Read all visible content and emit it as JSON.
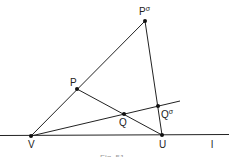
{
  "diagram": {
    "points": {
      "P_sigma": {
        "label": "P",
        "sup": "σ",
        "x": 145,
        "y": 21
      },
      "P": {
        "label": "P",
        "x": 77,
        "y": 89
      },
      "Q": {
        "label": "Q",
        "x": 124,
        "y": 114
      },
      "Q_sigma": {
        "label": "Q",
        "sup": "σ",
        "x": 158,
        "y": 106
      },
      "V": {
        "label": "V",
        "x": 31,
        "y": 136
      },
      "U": {
        "label": "U",
        "x": 162,
        "y": 135
      }
    },
    "line_label": "l",
    "caption": "Fig. 51"
  }
}
